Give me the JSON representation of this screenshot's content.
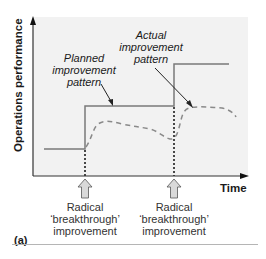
{
  "figure": {
    "panel_label": "(a)",
    "y_axis_label": "Operations performance",
    "x_axis_label": "Time",
    "annotations": {
      "planned": [
        "Planned",
        "improvement",
        "pattern"
      ],
      "actual": [
        "Actual",
        "improvement",
        "pattern"
      ]
    },
    "events": [
      {
        "label_lines": [
          "Radical",
          "‘breakthrough’",
          "improvement"
        ]
      },
      {
        "label_lines": [
          "Radical",
          "‘breakthrough’",
          "improvement"
        ]
      }
    ],
    "colors": {
      "plot_background": "#f2f2f2",
      "planned_line": "#7a7a7a",
      "actual_line": "#8a8a8a",
      "axis": "#333333",
      "event_marker": "#111111",
      "arrow_fill": "#d9d9d9"
    }
  }
}
